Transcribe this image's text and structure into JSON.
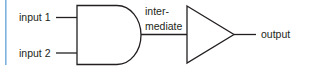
{
  "diagram": {
    "type": "logic-circuit",
    "accent_bar_color": "#7fb2e0",
    "stroke_color": "#231f20",
    "labels": {
      "input1": "input 1",
      "input2": "input 2",
      "intermediate_line1": "inter-",
      "intermediate_line2": "mediate",
      "output": "output"
    },
    "components": [
      {
        "id": "and-gate",
        "kind": "AND gate",
        "inputs": [
          "input 1",
          "input 2"
        ],
        "output": "intermediate"
      },
      {
        "id": "buffer",
        "kind": "buffer (triangle)",
        "input": "intermediate",
        "output": "output"
      }
    ]
  }
}
